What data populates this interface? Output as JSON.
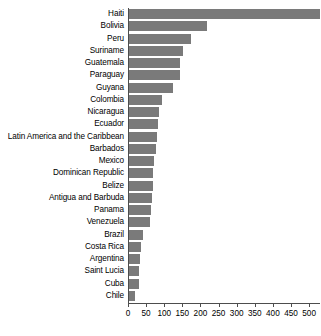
{
  "chart_data": {
    "type": "bar",
    "orientation": "horizontal",
    "title": "",
    "subtitle": "",
    "xlabel": "",
    "ylabel": "",
    "xlim": [
      0,
      530
    ],
    "grid": false,
    "legend": null,
    "bar_color": "#7a7a7a",
    "axis_color": "#4d4d4d",
    "background_color": "#ffffff",
    "xticks": [
      0,
      50,
      100,
      150,
      200,
      250,
      300,
      350,
      400,
      450,
      500
    ],
    "xtick_labels": [
      "0",
      "50",
      "100",
      "150",
      "200",
      "250",
      "300",
      "350",
      "400",
      "450",
      "500"
    ],
    "categories": [
      "Haiti",
      "Bolivia",
      "Peru",
      "Suriname",
      "Guatemala",
      "Paraguay",
      "Guyana",
      "Colombia",
      "Nicaragua",
      "Ecuador",
      "Latin America and the Caribbean",
      "Barbados",
      "Mexico",
      "Dominican Republic",
      "Belize",
      "Antigua and Barbuda",
      "Panama",
      "Venezuela",
      "Brazil",
      "Costa Rica",
      "Argentina",
      "Saint Lucia",
      "Cuba",
      "Chile"
    ],
    "values": [
      529,
      218,
      175,
      152,
      143,
      143,
      123,
      95,
      86,
      83,
      81,
      76,
      72,
      70,
      68,
      66,
      63,
      60,
      41,
      35,
      33,
      31,
      30,
      20
    ]
  }
}
